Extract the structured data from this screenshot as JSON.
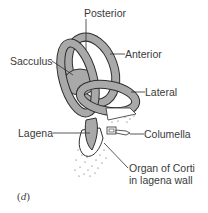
{
  "figure": {
    "panel_label_open": "(",
    "panel_letter": "d",
    "panel_label_close": ")",
    "labels": {
      "posterior": "Posterior",
      "anterior": "Anterior",
      "sacculus": "Sacculus",
      "lateral": "Lateral",
      "lagena": "Lagena",
      "columella": "Columella",
      "organ_of_corti_line1": "Organ of Corti",
      "organ_of_corti_line2": "in lagena wall"
    },
    "colors": {
      "fill": "#a9a9a9",
      "stroke": "#2e2e2e",
      "text": "#3a3a3a"
    }
  }
}
